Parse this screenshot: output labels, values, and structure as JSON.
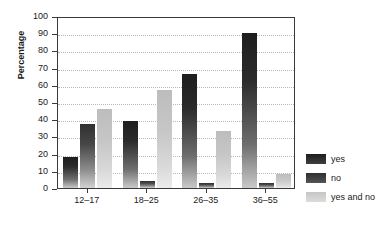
{
  "chart_data": {
    "type": "bar",
    "title": "",
    "subtitle": "",
    "xlabel": "",
    "ylabel": "Percentage",
    "categories": [
      "12–17",
      "18–25",
      "26–35",
      "36–55"
    ],
    "series": [
      {
        "name": "yes",
        "values": [
          18,
          39,
          66,
          90
        ]
      },
      {
        "name": "no",
        "values": [
          37,
          4,
          3,
          3
        ]
      },
      {
        "name": "yes and no",
        "values": [
          46,
          57,
          33,
          8
        ]
      }
    ],
    "ylim": [
      0,
      100
    ],
    "ytick_step": 10,
    "yticks": [
      0,
      10,
      20,
      30,
      40,
      50,
      60,
      70,
      80,
      90,
      100
    ],
    "ytick_labels": [
      "0",
      "10",
      "20",
      "30",
      "40",
      "50",
      "60",
      "70",
      "80",
      "90",
      "100"
    ],
    "grid": true,
    "grid_axis": "y",
    "grid_style": "dotted",
    "legend_position": "right",
    "colors": {
      "yes": "#262626",
      "no": "#474747",
      "yes and no": "#cccccc",
      "axis": "#3a3a3a",
      "grid": "#b8b8b8",
      "text": "#1a1a1a",
      "background": "#ffffff"
    }
  }
}
